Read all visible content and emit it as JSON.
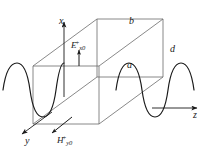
{
  "figure": {
    "kind": "rectangular-waveguide-field-diagram",
    "stroke_color": "#4a4a4a",
    "axis_color": "#1a1a1a",
    "wave_color": "#1a1a1a",
    "background": "#ffffff",
    "axes": [
      {
        "id": "x",
        "label": "x",
        "direction": "up"
      },
      {
        "id": "y",
        "label": "y",
        "direction": "down-left"
      },
      {
        "id": "z",
        "label": "z",
        "direction": "right"
      }
    ],
    "dimensions": [
      {
        "id": "b",
        "label": "b",
        "edge": "top-front"
      },
      {
        "id": "d",
        "label": "d",
        "edge": "right-vertical"
      },
      {
        "id": "a",
        "label": "a",
        "edge": "diagonal-depth"
      }
    ],
    "fields": [
      {
        "id": "E",
        "base": "E",
        "superscript": "+",
        "subscript": "x0",
        "text": "E",
        "sup_text": "+",
        "sub_text": "x0",
        "arrow": "up"
      },
      {
        "id": "H",
        "base": "H",
        "superscript": "+",
        "subscript": "y0",
        "text": "H",
        "sup_text": "+",
        "sub_text": "y0",
        "arrow": "down-left"
      }
    ],
    "waves": [
      {
        "id": "wave-left",
        "cycles": 1.5,
        "amplitude": 26
      },
      {
        "id": "wave-right",
        "cycles": 1.5,
        "amplitude": 26
      }
    ]
  }
}
